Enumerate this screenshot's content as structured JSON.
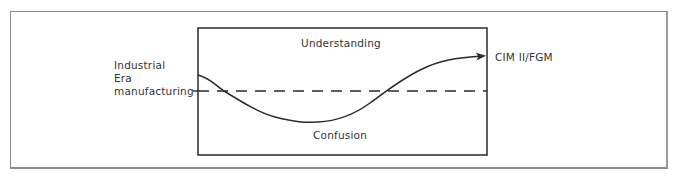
{
  "diagram": {
    "regions": {
      "upper": "Understanding",
      "lower": "Confusion"
    },
    "start_label": [
      "Industrial",
      "Era",
      "manufacturing"
    ],
    "end_label": "CIM II/FGM",
    "reference_line": "dashed",
    "colors": {
      "line": "#2a2a2a",
      "frame": "#8a8a8a",
      "background": "#ffffff"
    }
  }
}
